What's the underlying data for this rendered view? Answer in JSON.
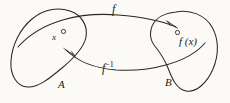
{
  "figure": {
    "kind": "function-mapping-diagram",
    "background_color": "#fbfaf7",
    "ink_color": "#2b2724",
    "sets": [
      {
        "id": "domain",
        "label": "A",
        "shape": "blob",
        "side": "left",
        "element_label": "x",
        "element_marker": "open-circle"
      },
      {
        "id": "codomain",
        "label": "B",
        "shape": "blob",
        "side": "right",
        "element_label": "f (x)",
        "element_marker": "open-circle"
      }
    ],
    "arrows": [
      {
        "id": "forward-map",
        "label": "f",
        "label_position": "above",
        "from": "A",
        "to": "B",
        "direction": "left-to-right",
        "head": "solid-triangle"
      },
      {
        "id": "inverse-map",
        "label_base": "f",
        "label_exponent": "-1",
        "label_position": "below",
        "from": "B",
        "to": "A",
        "direction": "right-to-left",
        "head": "solid-triangle"
      }
    ]
  },
  "labels": {
    "f": "f",
    "f_inverse_base": "f",
    "f_inverse_exponent": "−1",
    "x": "x",
    "fx": "f (x)",
    "set_a": "A",
    "set_b": "B"
  }
}
